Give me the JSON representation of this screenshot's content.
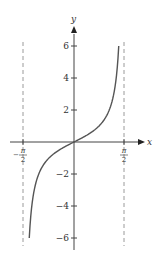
{
  "chart_data": {
    "type": "line",
    "title": "",
    "function": "y = tan x",
    "xlabel": "x",
    "ylabel": "y",
    "xlim": [
      -1.5708,
      1.5708
    ],
    "ylim": [
      -6,
      6
    ],
    "x_tick_labels": [
      {
        "value": -1.5708,
        "num": "π",
        "den": "2",
        "sign": "−"
      },
      {
        "value": 1.5708,
        "num": "π",
        "den": "2",
        "sign": ""
      }
    ],
    "y_ticks": [
      6,
      4,
      2,
      -2,
      -4,
      -6
    ],
    "y_tick_labels": [
      "6",
      "4",
      "2",
      "−2",
      "−4",
      "−6"
    ],
    "asymptotes": [
      -1.5708,
      1.5708
    ],
    "asymptote_style": "dashed",
    "grid": false,
    "legend": null,
    "series": [
      {
        "name": "tan x",
        "x": [
          -1.4056,
          -1.3734,
          -1.3,
          -1.2,
          -1.0,
          -0.8,
          -0.6,
          -0.4,
          -0.2,
          0,
          0.2,
          0.4,
          0.6,
          0.8,
          1.0,
          1.2,
          1.3,
          1.3734,
          1.4056
        ],
        "y": [
          -6,
          -5,
          -3.6,
          -2.57,
          -1.56,
          -1.03,
          -0.68,
          -0.42,
          -0.2,
          0,
          0.2,
          0.42,
          0.68,
          1.03,
          1.56,
          2.57,
          3.6,
          5,
          6
        ]
      }
    ]
  },
  "labels": {
    "x_axis": "x",
    "y_axis": "y",
    "neg_half_pi_sign": "−",
    "pi": "π",
    "two": "2",
    "y6": "6",
    "y4": "4",
    "y2": "2",
    "ym2": "−2",
    "ym4": "−4",
    "ym6": "−6"
  }
}
